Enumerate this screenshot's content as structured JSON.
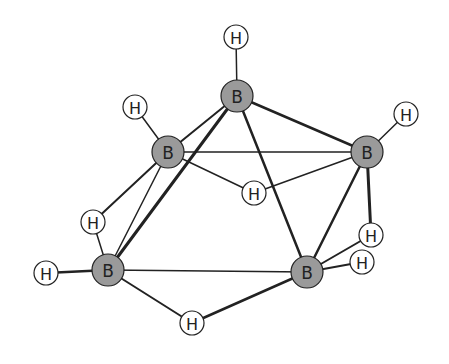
{
  "diagram": {
    "colors": {
      "boron_fill": "#9a9a9a",
      "hydrogen_fill": "#ffffff",
      "stroke": "#222222",
      "background": "#ffffff"
    },
    "atoms": [
      {
        "id": "B1",
        "element": "B",
        "label": "B",
        "x": 237,
        "y": 96,
        "r": 16
      },
      {
        "id": "B2",
        "element": "B",
        "label": "B",
        "x": 168,
        "y": 152,
        "r": 16
      },
      {
        "id": "B3",
        "element": "B",
        "label": "B",
        "x": 367,
        "y": 152,
        "r": 16
      },
      {
        "id": "B4",
        "element": "B",
        "label": "B",
        "x": 108,
        "y": 270,
        "r": 16
      },
      {
        "id": "B5",
        "element": "B",
        "label": "B",
        "x": 307,
        "y": 272,
        "r": 16
      },
      {
        "id": "H1",
        "element": "H",
        "label": "H",
        "x": 236,
        "y": 37,
        "r": 12
      },
      {
        "id": "H2",
        "element": "H",
        "label": "H",
        "x": 135,
        "y": 107,
        "r": 12
      },
      {
        "id": "H3",
        "element": "H",
        "label": "H",
        "x": 406,
        "y": 114,
        "r": 12
      },
      {
        "id": "H4",
        "element": "H",
        "label": "H",
        "x": 254,
        "y": 193,
        "r": 12
      },
      {
        "id": "H5",
        "element": "H",
        "label": "H",
        "x": 93,
        "y": 222,
        "r": 12
      },
      {
        "id": "H6",
        "element": "H",
        "label": "H",
        "x": 46,
        "y": 273,
        "r": 12
      },
      {
        "id": "H7",
        "element": "H",
        "label": "H",
        "x": 192,
        "y": 323,
        "r": 12
      },
      {
        "id": "H8",
        "element": "H",
        "label": "H",
        "x": 371,
        "y": 235,
        "r": 12
      },
      {
        "id": "H9",
        "element": "H",
        "label": "H",
        "x": 362,
        "y": 262,
        "r": 12
      }
    ],
    "bonds": [
      {
        "from": "H1",
        "to": "B1",
        "w": 1.5
      },
      {
        "from": "H2",
        "to": "B2",
        "w": 1.5
      },
      {
        "from": "H3",
        "to": "B3",
        "w": 1.5
      },
      {
        "from": "H6",
        "to": "B4",
        "w": 2.5
      },
      {
        "from": "B1",
        "to": "B2",
        "w": 2
      },
      {
        "from": "B1",
        "to": "B3",
        "w": 2.5
      },
      {
        "from": "B1",
        "to": "B4",
        "w": 3
      },
      {
        "from": "B1",
        "to": "B5",
        "w": 2.5
      },
      {
        "from": "B2",
        "to": "B3",
        "w": 1.5
      },
      {
        "from": "B2",
        "to": "B4",
        "w": 1.5
      },
      {
        "from": "B3",
        "to": "B5",
        "w": 2.5
      },
      {
        "from": "B4",
        "to": "B5",
        "w": 1.5
      },
      {
        "from": "B2",
        "to": "H4",
        "w": 1.5
      },
      {
        "from": "H4",
        "to": "B3",
        "w": 1.5
      },
      {
        "from": "B2",
        "to": "H5",
        "w": 2
      },
      {
        "from": "H5",
        "to": "B4",
        "w": 1.5
      },
      {
        "from": "B4",
        "to": "H7",
        "w": 2
      },
      {
        "from": "H7",
        "to": "B5",
        "w": 2.5
      },
      {
        "from": "B3",
        "to": "H8",
        "w": 3
      },
      {
        "from": "H8",
        "to": "B5",
        "w": 2
      },
      {
        "from": "H9",
        "to": "B5",
        "w": 2
      }
    ]
  }
}
